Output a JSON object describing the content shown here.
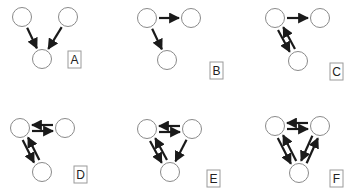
{
  "panels": [
    {
      "label": "A",
      "nodes": [
        [
          22,
          17
        ],
        [
          68,
          17
        ],
        [
          42,
          59
        ]
      ],
      "edges": [
        [
          0,
          2
        ],
        [
          1,
          2
        ]
      ],
      "label_box": [
        68,
        51
      ]
    },
    {
      "label": "B",
      "nodes": [
        [
          147,
          18
        ],
        [
          191,
          18
        ],
        [
          167,
          60
        ]
      ],
      "edges": [
        [
          0,
          1
        ],
        [
          0,
          2
        ]
      ],
      "label_box": [
        210,
        62
      ]
    },
    {
      "label": "C",
      "nodes": [
        [
          275,
          18
        ],
        [
          320,
          18
        ],
        [
          298,
          61
        ]
      ],
      "edges": [
        [
          0,
          1
        ],
        [
          0,
          2
        ],
        [
          2,
          0
        ]
      ],
      "label_box": [
        330,
        63
      ]
    },
    {
      "label": "D",
      "nodes": [
        [
          20,
          128
        ],
        [
          65,
          128
        ],
        [
          42,
          172
        ]
      ],
      "edges": [
        [
          1,
          0
        ],
        [
          0,
          1
        ],
        [
          0,
          2
        ],
        [
          2,
          0
        ]
      ],
      "label_box": [
        74,
        166
      ]
    },
    {
      "label": "E",
      "nodes": [
        [
          147,
          129
        ],
        [
          192,
          129
        ],
        [
          170,
          172
        ]
      ],
      "edges": [
        [
          0,
          1
        ],
        [
          1,
          0
        ],
        [
          0,
          2
        ],
        [
          2,
          0
        ],
        [
          1,
          2
        ]
      ],
      "label_box": [
        207,
        170
      ]
    },
    {
      "label": "F",
      "nodes": [
        [
          275,
          126
        ],
        [
          320,
          126
        ],
        [
          299,
          173
        ]
      ],
      "edges": [
        [
          0,
          1
        ],
        [
          1,
          0
        ],
        [
          0,
          2
        ],
        [
          2,
          0
        ],
        [
          1,
          2
        ],
        [
          2,
          1
        ]
      ],
      "label_box": [
        330,
        170
      ]
    }
  ],
  "style": {
    "node_radius": 9.5,
    "node_stroke": "#8a8a8a",
    "edge_color": "#1a1a1a"
  }
}
